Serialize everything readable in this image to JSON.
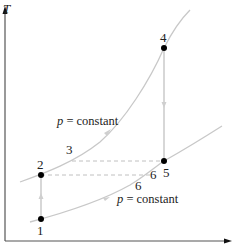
{
  "diagram": {
    "type": "T-s diagram (thermodynamic cycle)",
    "axes": {
      "y_label": "T",
      "x_label": ""
    },
    "curves": [
      {
        "id": "upper-isobar",
        "label": "p = constant",
        "label_var": "p",
        "label_rest": " = constant"
      },
      {
        "id": "lower-isobar",
        "label": "p = constant",
        "label_var": "p",
        "label_rest": " = constant"
      }
    ],
    "states": [
      {
        "id": "1",
        "label": "1"
      },
      {
        "id": "2",
        "label": "2"
      },
      {
        "id": "3",
        "label": "3"
      },
      {
        "id": "4",
        "label": "4"
      },
      {
        "id": "5",
        "label": "5"
      },
      {
        "id": "6a",
        "label": "6"
      },
      {
        "id": "6b",
        "label": "6"
      }
    ],
    "colors": {
      "axis": "#555555",
      "curve": "#c8c8c8",
      "process_line": "#bdbdbd",
      "dashed": "#c0c0c0",
      "point": "#000000",
      "text": "#222222"
    }
  }
}
